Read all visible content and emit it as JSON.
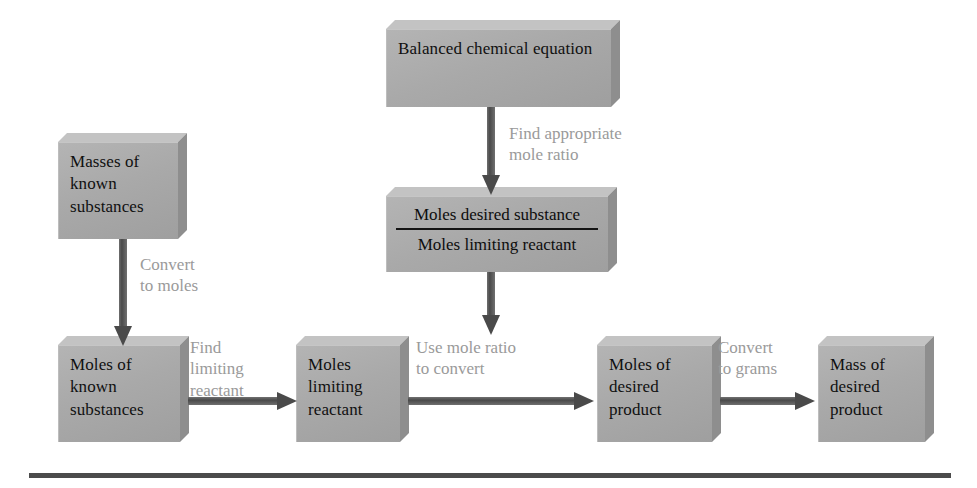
{
  "figure": {
    "type": "flowchart",
    "colors": {
      "box_fill": "#a9a9a9",
      "box_bevel_top": "#c3c3c3",
      "box_bevel_right": "#8e8e8e",
      "box_text": "#101010",
      "connector_label_text": "#9a9a9a",
      "arrow": "#4a4a4a",
      "rule": "#4b4b4b",
      "background": "#ffffff"
    }
  },
  "nodes": {
    "balanced_equation": "Balanced chemical\nequation",
    "masses_known": "Masses of\nknown\nsubstances",
    "mole_ratio_numerator": "Moles desired substance",
    "mole_ratio_denominator": "Moles limiting reactant",
    "moles_known": "Moles of\nknown\nsubstances",
    "moles_limiting": "Moles\nlimiting\nreactant",
    "moles_desired": "Moles of\ndesired\nproduct",
    "mass_desired": "Mass of\ndesired\nproduct"
  },
  "connectors": {
    "find_mole_ratio": "Find appropriate\nmole ratio",
    "convert_to_moles": "Convert\nto moles",
    "find_limiting": "Find\nlimiting\nreactant",
    "use_mole_ratio": "Use mole ratio\nto convert",
    "convert_to_grams": "Convert\nto grams"
  },
  "edges": [
    {
      "from": "balanced_equation",
      "to": "mole_ratio",
      "label": "Find appropriate mole ratio",
      "direction": "down"
    },
    {
      "from": "mole_ratio",
      "to": "use_mole_ratio_arrow",
      "label": "",
      "direction": "down"
    },
    {
      "from": "masses_known",
      "to": "moles_known",
      "label": "Convert to moles",
      "direction": "down"
    },
    {
      "from": "moles_known",
      "to": "moles_limiting",
      "label": "Find limiting reactant",
      "direction": "right"
    },
    {
      "from": "moles_limiting",
      "to": "moles_desired",
      "label": "Use mole ratio to convert",
      "direction": "right"
    },
    {
      "from": "moles_desired",
      "to": "mass_desired",
      "label": "Convert to grams",
      "direction": "right"
    }
  ]
}
